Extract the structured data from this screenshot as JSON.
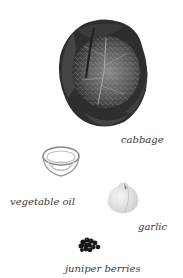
{
  "ingredients": [
    {
      "id": "cabbage",
      "label": "cabbage",
      "icon": "cabbage-icon"
    },
    {
      "id": "vegetable-oil",
      "label": "vegetable oil",
      "icon": "oil-bowl-icon"
    },
    {
      "id": "garlic",
      "label": "garlic",
      "icon": "garlic-icon"
    },
    {
      "id": "juniper-berries",
      "label": "juniper berries",
      "icon": "juniper-berries-icon"
    }
  ],
  "colors": {
    "background": "#ffffff",
    "label_text": "#3a3a3a",
    "cabbage_dark": "#2e2e2e",
    "cabbage_mid": "#6a6a6a",
    "garlic": "#e6e6e6",
    "berries": "#1a1a1a"
  }
}
